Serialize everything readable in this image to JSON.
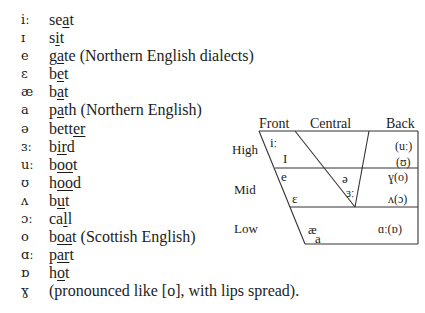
{
  "vowel_list": [
    {
      "symbol": "iː",
      "pre": "se",
      "mark": "a",
      "post": "t",
      "note": ""
    },
    {
      "symbol": "ɪ",
      "pre": "s",
      "mark": "i",
      "post": "t",
      "note": ""
    },
    {
      "symbol": "e",
      "pre": "g",
      "mark": "a",
      "post": "te",
      "note": " (Northern English dialects)"
    },
    {
      "symbol": "ɛ",
      "pre": "b",
      "mark": "e",
      "post": "t",
      "note": ""
    },
    {
      "symbol": "æ",
      "pre": "b",
      "mark": "a",
      "post": "t",
      "note": ""
    },
    {
      "symbol": "a",
      "pre": "p",
      "mark": "a",
      "post": "th",
      "note": " (Northern English)"
    },
    {
      "symbol": "ə",
      "pre": "bett",
      "mark": "er",
      "post": "",
      "note": ""
    },
    {
      "symbol": "ɜː",
      "pre": "b",
      "mark": "ir",
      "post": "d",
      "note": ""
    },
    {
      "symbol": "uː",
      "pre": "b",
      "mark": "oo",
      "post": "t",
      "note": ""
    },
    {
      "symbol": "ʊ",
      "pre": "h",
      "mark": "oo",
      "post": "d",
      "note": ""
    },
    {
      "symbol": "ʌ",
      "pre": "b",
      "mark": "u",
      "post": "t",
      "note": ""
    },
    {
      "symbol": "ɔː",
      "pre": "ca",
      "mark": "l",
      "post": "l",
      "note": ""
    },
    {
      "symbol": "o",
      "pre": "b",
      "mark": "oa",
      "post": "t",
      "note": " (Scottish English)"
    },
    {
      "symbol": "ɑː",
      "pre": "p",
      "mark": "ar",
      "post": "t",
      "note": ""
    },
    {
      "symbol": "ɒ",
      "pre": "h",
      "mark": "o",
      "post": "t",
      "note": ""
    },
    {
      "symbol": "ɣ",
      "pre": "(pronounced like [o], with lips spread).",
      "mark": "",
      "post": "",
      "note": ""
    }
  ],
  "vowel_chart": {
    "columns": [
      "Front",
      "Central",
      "Back"
    ],
    "rows": [
      "High",
      "Mid",
      "Low"
    ],
    "symbols": {
      "high_front_1": "iː",
      "high_front_2": "I",
      "high_back_1": "(uː)",
      "high_back_2": "(ʊ)",
      "mid_front_1": "e",
      "mid_front_2": "ɛ",
      "mid_central_1": "ə",
      "mid_central_2": "ɜː",
      "mid_back_1": "ɣ(o)",
      "mid_back_2": "ʌ(ɔ)",
      "low_front_1": "æ",
      "low_front_2": "a",
      "low_back": "ɑː(ɒ)"
    }
  }
}
